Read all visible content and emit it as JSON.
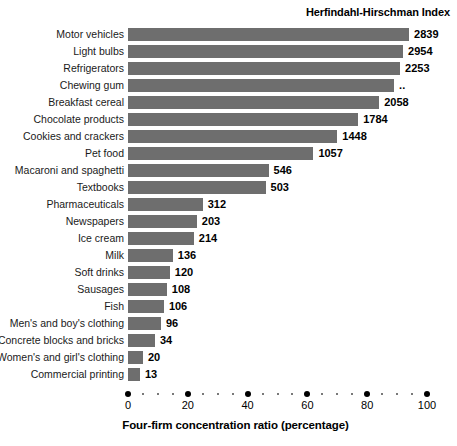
{
  "chart_data": {
    "type": "bar",
    "orientation": "horizontal",
    "title": "",
    "header_right": "Herfindahl-Hirschman Index",
    "xlabel": "Four-firm concentration ratio (percentage)",
    "ylabel": "",
    "xlim": [
      0,
      100
    ],
    "xticks": [
      0,
      20,
      40,
      60,
      80,
      100
    ],
    "xtick_labels": [
      "0",
      "20",
      "40",
      "60",
      "80",
      "100"
    ],
    "minor_tick_step": 5,
    "grid": false,
    "legend": "none",
    "bar_color": "#6e6e6e",
    "categories": [
      "Motor vehicles",
      "Light bulbs",
      "Refrigerators",
      "Chewing gum",
      "Breakfast cereal",
      "Chocolate products",
      "Cookies and crackers",
      "Pet food",
      "Macaroni and spaghetti",
      "Textbooks",
      "Pharmaceuticals",
      "Newspapers",
      "Ice cream",
      "Milk",
      "Soft drinks",
      "Sausages",
      "Fish",
      "Men's and boy's clothing",
      "Concrete blocks and bricks",
      "Women's and girl's clothing",
      "Commercial printing"
    ],
    "series": [
      {
        "name": "Four-firm concentration ratio (percentage)",
        "values": [
          94,
          92,
          91,
          89,
          84,
          77,
          70,
          62,
          47,
          46,
          25,
          23,
          22,
          15,
          14,
          13,
          12,
          11,
          9,
          5,
          4
        ]
      }
    ],
    "value_labels": [
      "2839",
      "2954",
      "2253",
      "..",
      "2058",
      "1784",
      "1448",
      "1057",
      "546",
      "503",
      "312",
      "203",
      "214",
      "136",
      "120",
      "108",
      "106",
      "96",
      "34",
      "20",
      "13"
    ],
    "value_label_note": ".. means not available"
  }
}
